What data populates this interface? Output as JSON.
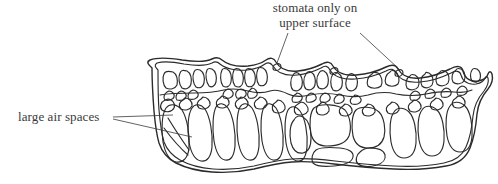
{
  "diagram": {
    "type": "biological-cross-section",
    "stroke_color": "#2b2b2b",
    "fill_color": "#ffffff",
    "background_color": "#ffffff",
    "text_color": "#3a3a3a"
  },
  "labels": {
    "stomata": {
      "line1": "stomata only on",
      "line2": "upper surface",
      "leader_count": 2
    },
    "air_spaces": {
      "text": "large air spaces",
      "leader_count": 2
    }
  }
}
